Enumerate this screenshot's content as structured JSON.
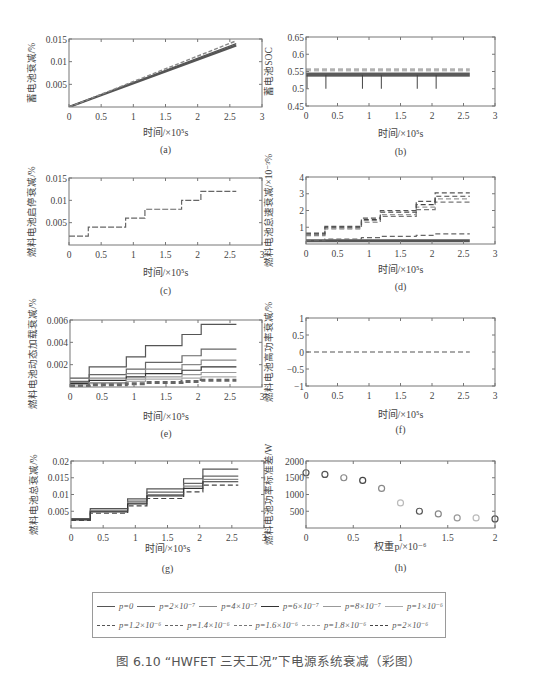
{
  "caption": "图 6.10 “HWFET 三天工况”下电源系统衰减（彩图）",
  "legend": {
    "row1": [
      {
        "label": "p=0",
        "style": "solid",
        "color": "#555555"
      },
      {
        "label": "p=2×10⁻⁷",
        "style": "solid",
        "color": "#666666"
      },
      {
        "label": "p=4×10⁻⁷",
        "style": "solid",
        "color": "#888888"
      },
      {
        "label": "p=6×10⁻⁷",
        "style": "solid",
        "color": "#333333"
      },
      {
        "label": "p=8×10⁻⁷",
        "style": "solid",
        "color": "#999999"
      },
      {
        "label": "p=1×10⁻⁶",
        "style": "solid",
        "color": "#aaaaaa"
      }
    ],
    "row2": [
      {
        "label": "p=1.2×10⁻⁶",
        "style": "dashed",
        "color": "#555555"
      },
      {
        "label": "p=1.4×10⁻⁶",
        "style": "dashed",
        "color": "#666666"
      },
      {
        "label": "p=1.6×10⁻⁶",
        "style": "dashed",
        "color": "#777777"
      },
      {
        "label": "p=1.8×10⁻⁶",
        "style": "dashed",
        "color": "#999999"
      },
      {
        "label": "p=2×10⁻⁶",
        "style": "dashed",
        "color": "#444444"
      }
    ]
  },
  "chart_data": [
    {
      "id": "a",
      "panel_label": "(a)",
      "type": "line",
      "title": "",
      "xlabel": "时间/×10⁵s",
      "ylabel": "蓄电池衰减/%",
      "xlim": [
        0,
        3
      ],
      "ylim": [
        0,
        0.015
      ],
      "xticks": [
        "0",
        "0.5",
        "1",
        "1.5",
        "2",
        "2.5",
        "3"
      ],
      "yticks": [
        "0.005",
        "0.01",
        "0.015"
      ],
      "grid": false,
      "series": [
        {
          "name": "p=0",
          "x": [
            0,
            2.6
          ],
          "values": [
            0,
            0.0136
          ]
        },
        {
          "name": "p=1×10⁻⁶",
          "x": [
            0,
            2.6
          ],
          "values": [
            0,
            0.014
          ]
        },
        {
          "name": "p=2×10⁻⁶",
          "x": [
            0,
            2.6
          ],
          "values": [
            0,
            0.0146
          ]
        }
      ]
    },
    {
      "id": "b",
      "panel_label": "(b)",
      "type": "line",
      "title": "",
      "xlabel": "时间/×10⁵s",
      "ylabel": "蓄电池SOC",
      "xlim": [
        0,
        3
      ],
      "ylim": [
        0.45,
        0.65
      ],
      "xticks": [
        "0",
        "0.5",
        "1",
        "1.5",
        "2",
        "2.5",
        "3"
      ],
      "yticks": [
        "0.45",
        "0.5",
        "0.55",
        "0.6",
        "0.65"
      ],
      "grid": false,
      "dip_times": [
        0,
        0.3,
        0.88,
        1.18,
        1.75,
        2.05
      ],
      "dip_value": 0.5,
      "series": [
        {
          "name": "solid band (p=0…1×10⁻⁶)",
          "x": [
            0,
            2.6
          ],
          "values": [
            0.54,
            0.54
          ]
        },
        {
          "name": "dashed upper (p=1.2…2×10⁻⁶)",
          "x": [
            0,
            2.6
          ],
          "values": [
            0.557,
            0.557
          ]
        }
      ]
    },
    {
      "id": "c",
      "panel_label": "(c)",
      "type": "line",
      "title": "",
      "xlabel": "时间/×10⁵s",
      "ylabel": "燃料电池启停衰减/%",
      "xlim": [
        0,
        3
      ],
      "ylim": [
        0,
        0.015
      ],
      "xticks": [
        "0",
        "0.5",
        "1",
        "1.5",
        "2",
        "2.5",
        "3"
      ],
      "yticks": [
        "0.005",
        "0.01",
        "0.015"
      ],
      "grid": false,
      "series": [
        {
          "name": "all p",
          "x": [
            0,
            0.3,
            0.3,
            0.88,
            0.88,
            1.18,
            1.18,
            1.75,
            1.75,
            2.05,
            2.05,
            2.6
          ],
          "values": [
            0.002,
            0.002,
            0.004,
            0.004,
            0.006,
            0.006,
            0.008,
            0.008,
            0.01,
            0.01,
            0.012,
            0.012
          ]
        }
      ]
    },
    {
      "id": "d",
      "panel_label": "(d)",
      "type": "line",
      "title": "",
      "xlabel": "时间/×10⁵s",
      "ylabel": "燃料电池怠速衰减/×10⁻³%",
      "xlim": [
        0,
        3
      ],
      "ylim": [
        0,
        4
      ],
      "xticks": [
        "0",
        "0.5",
        "1",
        "1.5",
        "2",
        "2.5",
        "3"
      ],
      "yticks": [
        "1",
        "2",
        "3",
        "4"
      ],
      "grid": false,
      "steps_x": [
        0,
        0.3,
        0.88,
        1.18,
        1.75,
        2.05,
        2.6
      ],
      "series": [
        {
          "name": "p=0…1×10⁻⁶ (solid)",
          "values": [
            0.2,
            0.2,
            0.2,
            0.2,
            0.2,
            0.2
          ]
        },
        {
          "name": "p=1.2×10⁻⁶",
          "values": [
            0.2,
            0.3,
            0.38,
            0.45,
            0.52,
            0.6
          ]
        },
        {
          "name": "p=1.4×10⁻⁶",
          "values": [
            0.5,
            0.9,
            1.3,
            1.65,
            2.05,
            2.5
          ]
        },
        {
          "name": "p=1.6×10⁻⁶",
          "values": [
            0.55,
            0.95,
            1.4,
            1.75,
            2.2,
            2.7
          ]
        },
        {
          "name": "p=1.8×10⁻⁶",
          "values": [
            0.6,
            1.0,
            1.45,
            1.9,
            2.35,
            2.85
          ]
        },
        {
          "name": "p=2×10⁻⁶",
          "values": [
            0.65,
            1.05,
            1.55,
            2.0,
            2.55,
            3.05
          ]
        }
      ]
    },
    {
      "id": "e",
      "panel_label": "(e)",
      "type": "line",
      "title": "",
      "xlabel": "时间/×10⁵s",
      "ylabel": "燃料电池动态加载衰减/%",
      "xlim": [
        0,
        3
      ],
      "ylim": [
        0,
        0.006
      ],
      "xticks": [
        "0",
        "0.5",
        "1",
        "1.5",
        "2",
        "2.5",
        "3"
      ],
      "yticks": [
        "0.002",
        "0.004",
        "0.006"
      ],
      "grid": false,
      "steps_x": [
        0,
        0.3,
        0.88,
        1.18,
        1.75,
        2.05,
        2.6
      ],
      "series": [
        {
          "name": "p=0",
          "values": [
            0.0008,
            0.0018,
            0.0027,
            0.0037,
            0.0047,
            0.0056
          ]
        },
        {
          "name": "p=2×10⁻⁷",
          "values": [
            0.0005,
            0.0011,
            0.0016,
            0.0022,
            0.0028,
            0.0034
          ]
        },
        {
          "name": "p=4×10⁻⁷",
          "values": [
            0.0004,
            0.0008,
            0.0012,
            0.0016,
            0.002,
            0.0024
          ]
        },
        {
          "name": "p=6×10⁻⁷",
          "values": [
            0.0003,
            0.0006,
            0.0009,
            0.0012,
            0.0015,
            0.0018
          ]
        },
        {
          "name": "p=8×10⁻⁷",
          "values": [
            0.0002,
            0.0004,
            0.0007,
            0.0009,
            0.0011,
            0.0013
          ]
        },
        {
          "name": "p=1×10⁻⁶",
          "values": [
            0.0002,
            0.0003,
            0.0005,
            0.0007,
            0.0008,
            0.0009
          ]
        },
        {
          "name": "p=1.2…2×10⁻⁶ (dashed)",
          "values": [
            0.0001,
            0.0002,
            0.0003,
            0.0004,
            0.0005,
            0.0006
          ]
        }
      ]
    },
    {
      "id": "f",
      "panel_label": "(f)",
      "type": "line",
      "title": "",
      "xlabel": "时间/×10⁵s",
      "ylabel": "燃料电池高功率衰减/%",
      "xlim": [
        0,
        3
      ],
      "ylim": [
        -1,
        1
      ],
      "xticks": [
        "0",
        "0.5",
        "1",
        "1.5",
        "2",
        "2.5",
        "3"
      ],
      "yticks": [
        "-1",
        "-0.5",
        "0",
        "0.5",
        "1"
      ],
      "grid": false,
      "series": [
        {
          "name": "all p",
          "x": [
            0,
            2.6
          ],
          "values": [
            0,
            0
          ]
        }
      ]
    },
    {
      "id": "g",
      "panel_label": "(g)",
      "type": "line",
      "title": "",
      "xlabel": "时间/×10⁵s",
      "ylabel": "燃料电池总衰减/%",
      "xlim": [
        0,
        3
      ],
      "ylim": [
        0,
        0.02
      ],
      "xticks": [
        "0",
        "0.5",
        "1",
        "1.5",
        "2",
        "2.5",
        "3"
      ],
      "yticks": [
        "0.005",
        "0.01",
        "0.015",
        "0.02"
      ],
      "grid": false,
      "steps_x": [
        0,
        0.3,
        0.88,
        1.18,
        1.75,
        2.05,
        2.6
      ],
      "series": [
        {
          "name": "p=0",
          "values": [
            0.0028,
            0.0058,
            0.0087,
            0.0117,
            0.0147,
            0.0176
          ]
        },
        {
          "name": "p=2×10⁻⁷",
          "values": [
            0.0026,
            0.0053,
            0.008,
            0.0107,
            0.0133,
            0.0155
          ]
        },
        {
          "name": "p=6×10⁻⁷",
          "values": [
            0.0025,
            0.005,
            0.0075,
            0.01,
            0.0125,
            0.0145
          ]
        },
        {
          "name": "p=1×10⁻⁶",
          "values": [
            0.0024,
            0.0048,
            0.0072,
            0.0096,
            0.0118,
            0.0138
          ]
        },
        {
          "name": "p=2×10⁻⁶",
          "values": [
            0.0023,
            0.0044,
            0.0066,
            0.0088,
            0.0108,
            0.0128
          ]
        }
      ]
    },
    {
      "id": "h",
      "panel_label": "(h)",
      "type": "scatter",
      "title": "",
      "xlabel": "权重p/×10⁻⁶",
      "ylabel": "燃料电池功率标准差/W",
      "xlim": [
        0,
        2
      ],
      "ylim": [
        0,
        2000
      ],
      "xticks": [
        "0",
        "0.5",
        "1",
        "1.5",
        "2"
      ],
      "yticks": [
        "500",
        "1000",
        "1500",
        "2000"
      ],
      "grid": false,
      "x": [
        0,
        0.2,
        0.4,
        0.6,
        0.8,
        1.0,
        1.2,
        1.4,
        1.6,
        1.8,
        2.0
      ],
      "values": [
        1650,
        1600,
        1500,
        1420,
        1180,
        750,
        500,
        420,
        300,
        300,
        270
      ]
    }
  ]
}
